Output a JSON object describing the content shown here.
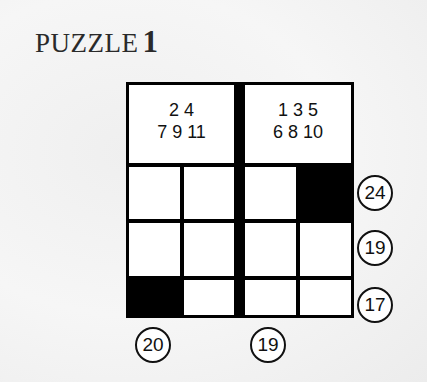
{
  "title": {
    "text": "PUZZLE",
    "number": "1"
  },
  "headers": [
    {
      "line1": "2 4",
      "line2": "7 9 11"
    },
    {
      "line1": "1 3 5",
      "line2": "6 8 10"
    }
  ],
  "grid": {
    "rows": 3,
    "cols": 4,
    "cells": [
      [
        "white",
        "white",
        "white",
        "black"
      ],
      [
        "white",
        "white",
        "white",
        "white"
      ],
      [
        "black",
        "white",
        "white",
        "white"
      ]
    ]
  },
  "row_clues": [
    "24",
    "19",
    "17"
  ],
  "column_clues": [
    "20",
    "19"
  ]
}
